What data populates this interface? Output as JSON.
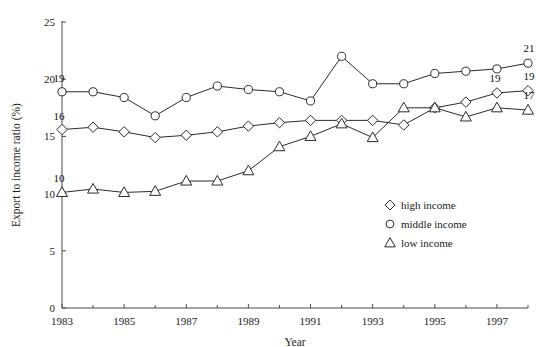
{
  "chart_data": {
    "type": "line",
    "title": "",
    "xlabel": "Year",
    "ylabel": "Export to income ratio (%)",
    "xlim": [
      1983,
      1998
    ],
    "ylim": [
      0,
      25
    ],
    "yticks": [
      0,
      5,
      10,
      15,
      20,
      25
    ],
    "xticks": [
      1983,
      1985,
      1987,
      1989,
      1991,
      1993,
      1995,
      1997
    ],
    "xtick_labels": [
      "1983",
      "1985",
      "1987",
      "1989",
      "1991",
      "1993",
      "1995",
      "1997"
    ],
    "ytick_labels": [
      "0",
      "5",
      "10",
      "15",
      "20",
      "25"
    ],
    "minor_xticks": [
      1984,
      1986,
      1988,
      1990,
      1992,
      1994,
      1996,
      1998
    ],
    "grid": false,
    "legend_position": "lower-right",
    "x": [
      1983,
      1984,
      1985,
      1986,
      1987,
      1988,
      1989,
      1990,
      1991,
      1992,
      1993,
      1994,
      1995,
      1996,
      1997,
      1998
    ],
    "series": [
      {
        "name": "high income",
        "marker": "diamond",
        "values": [
          15.6,
          15.8,
          15.4,
          14.9,
          15.1,
          15.4,
          15.9,
          16.2,
          16.4,
          16.4,
          16.4,
          16.0,
          17.5,
          18.0,
          18.8,
          19.0
        ],
        "start_label": "16",
        "end_label": "19"
      },
      {
        "name": "middle income",
        "marker": "circle",
        "values": [
          18.9,
          18.9,
          18.4,
          16.8,
          18.4,
          19.4,
          19.1,
          18.9,
          18.1,
          22.0,
          19.6,
          19.6,
          20.5,
          20.7,
          20.9,
          21.4
        ],
        "start_label": "19",
        "end_label": "21"
      },
      {
        "name": "low income",
        "marker": "triangle",
        "values": [
          10.1,
          10.4,
          10.1,
          10.2,
          11.1,
          11.1,
          12.0,
          14.1,
          15.0,
          16.1,
          14.9,
          17.5,
          17.5,
          16.7,
          17.5,
          17.3
        ],
        "start_label": "10",
        "end_label": "17"
      }
    ]
  },
  "legend": {
    "items": [
      {
        "label": "high income",
        "marker": "diamond"
      },
      {
        "label": "middle income",
        "marker": "circle"
      },
      {
        "label": "low income",
        "marker": "triangle"
      }
    ]
  },
  "colors": {
    "line": "#2b2b2b",
    "axis": "#4a4a4a",
    "marker_fill": "#ffffff",
    "text": "#1a1a1a",
    "background": "#ffffff"
  }
}
